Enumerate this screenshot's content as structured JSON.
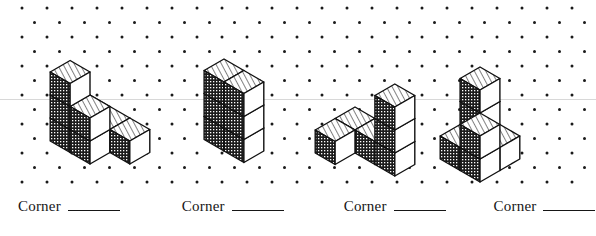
{
  "page": {
    "background_color": "#ffffff",
    "ink_color": "#161616",
    "width": 596,
    "height": 236
  },
  "dot_grid": {
    "name": "isometric-dot-grid",
    "dot_color": "#1a1a1a",
    "dot_radius": 1.5,
    "col_spacing": 25,
    "row_spacing": 14.5,
    "origin_x": 22,
    "origin_y": 8,
    "cols": 24,
    "rows": 13,
    "stagger": true
  },
  "scanline": {
    "name": "faint-scan-line",
    "color": "#d8d8d8",
    "y": 99.5,
    "thickness": 1
  },
  "cube_style": {
    "top_face": "diagonal-hatch",
    "left_face": "dark-checker",
    "right_face": "white",
    "top_fill": "#ffffff",
    "left_fill": "#1c1c1c",
    "right_fill": "#ffffff",
    "edge_color": "#111111",
    "edge_width": 1.4,
    "hatch_color": "#1a1a1a",
    "checker_color": "#ffffff"
  },
  "figures": [
    {
      "name": "figure-1",
      "index": 1,
      "cube_count": 8,
      "origin_x": 90,
      "origin_y": 118,
      "cell": 23,
      "description": "Two-level staircase corner block",
      "cubes": [
        {
          "x": 0,
          "y": 0,
          "z": 0
        },
        {
          "x": 1,
          "y": 0,
          "z": 0
        },
        {
          "x": 0,
          "y": 1,
          "z": 0
        },
        {
          "x": 1,
          "y": 1,
          "z": 0
        },
        {
          "x": 2,
          "y": 0,
          "z": 0
        },
        {
          "x": 0,
          "y": 1,
          "z": 1
        },
        {
          "x": 1,
          "y": 1,
          "z": 1
        },
        {
          "x": 0,
          "y": 1,
          "z": 2
        }
      ]
    },
    {
      "name": "figure-2",
      "index": 2,
      "cube_count": 6,
      "origin_x": 224,
      "origin_y": 128,
      "cell": 23,
      "description": "Two-wide three-tall wall with notch",
      "cubes": [
        {
          "x": 0,
          "y": 0,
          "z": 0
        },
        {
          "x": 1,
          "y": 0,
          "z": 0
        },
        {
          "x": 0,
          "y": 0,
          "z": 1
        },
        {
          "x": 1,
          "y": 0,
          "z": 1
        },
        {
          "x": 0,
          "y": 0,
          "z": 2
        },
        {
          "x": 1,
          "y": 0,
          "z": 2
        }
      ]
    },
    {
      "name": "figure-3",
      "index": 3,
      "cube_count": 6,
      "origin_x": 355,
      "origin_y": 130,
      "cell": 23,
      "description": "Row of three cubes with two-cube tower at far end",
      "cubes": [
        {
          "x": 0,
          "y": 0,
          "z": 0
        },
        {
          "x": 1,
          "y": 0,
          "z": 0
        },
        {
          "x": 2,
          "y": 0,
          "z": 0
        },
        {
          "x": 0,
          "y": 1,
          "z": 0
        },
        {
          "x": 2,
          "y": 0,
          "z": 1
        },
        {
          "x": 2,
          "y": 0,
          "z": 2
        }
      ]
    },
    {
      "name": "figure-4",
      "index": 4,
      "cube_count": 7,
      "origin_x": 480,
      "origin_y": 136,
      "cell": 23,
      "description": "Tall three-cube column with L-shaped foot",
      "cubes": [
        {
          "x": 0,
          "y": 0,
          "z": 0
        },
        {
          "x": 1,
          "y": 0,
          "z": 0
        },
        {
          "x": 0,
          "y": 1,
          "z": 0
        },
        {
          "x": 1,
          "y": 1,
          "z": 0
        },
        {
          "x": 0,
          "y": 0,
          "z": 1
        },
        {
          "x": 0,
          "y": 0,
          "z": 2
        },
        {
          "x": 1,
          "y": 1,
          "z": 1
        }
      ]
    }
  ],
  "labels": [
    {
      "name": "corner-label-1",
      "text": "Corner",
      "blank": "",
      "left": 18
    },
    {
      "name": "corner-label-2",
      "text": "Corner",
      "blank": "",
      "left": 158
    },
    {
      "name": "corner-label-3",
      "text": "Corner",
      "blank": "",
      "left": 297
    },
    {
      "name": "corner-label-4",
      "text": "Corner",
      "blank": "",
      "left": 424
    }
  ]
}
